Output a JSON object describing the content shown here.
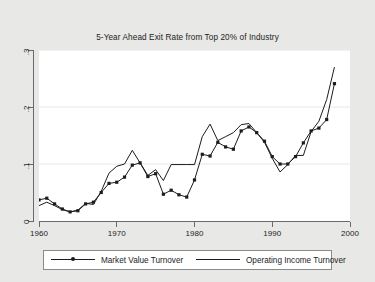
{
  "figure": {
    "background_color": "#e8e8e6",
    "plot_background_color": "#ffffff",
    "line_color": "#1c1c1c",
    "grid_color": "#e6e6e6"
  },
  "chart_data": {
    "type": "line",
    "title": "5-Year Ahead Exit Rate from Top 20% of Industry",
    "xlabel": "",
    "ylabel": "",
    "xlim": [
      1960,
      2000
    ],
    "ylim": [
      0,
      0.3
    ],
    "xticks": [
      1960,
      1970,
      1980,
      1990,
      2000
    ],
    "xtick_labels": [
      "1960",
      "1970",
      "1980",
      "1990",
      "2000"
    ],
    "yticks": [
      0,
      0.1,
      0.2,
      0.3
    ],
    "ytick_labels": [
      "0",
      ".1",
      ".2",
      ".3"
    ],
    "grid": "horizontal",
    "legend_position": "below",
    "x": [
      1960,
      1961,
      1962,
      1963,
      1964,
      1965,
      1966,
      1967,
      1968,
      1969,
      1970,
      1971,
      1972,
      1973,
      1974,
      1975,
      1976,
      1977,
      1978,
      1979,
      1980,
      1981,
      1982,
      1983,
      1984,
      1985,
      1986,
      1987,
      1988,
      1989,
      1990,
      1991,
      1992,
      1993,
      1994,
      1995,
      1996,
      1997,
      1998
    ],
    "series": [
      {
        "name": "Market Value Turnover",
        "marker": "square",
        "values": [
          0.037,
          0.04,
          0.03,
          0.021,
          0.016,
          0.018,
          0.03,
          0.033,
          0.05,
          0.066,
          0.068,
          0.077,
          0.098,
          0.102,
          0.078,
          0.083,
          0.047,
          0.054,
          0.046,
          0.042,
          0.072,
          0.117,
          0.114,
          0.138,
          0.13,
          0.126,
          0.158,
          0.165,
          0.155,
          0.14,
          0.113,
          0.1,
          0.1,
          0.113,
          0.137,
          0.158,
          0.163,
          0.178,
          0.241
        ]
      },
      {
        "name": "Operating Income Turnover",
        "marker": "none",
        "values": [
          0.027,
          0.033,
          0.027,
          0.02,
          0.016,
          0.019,
          0.031,
          0.029,
          0.052,
          0.084,
          0.096,
          0.1,
          0.124,
          0.102,
          0.08,
          0.09,
          0.071,
          0.099,
          0.099,
          0.099,
          0.099,
          0.148,
          0.17,
          0.141,
          0.148,
          0.155,
          0.169,
          0.171,
          0.155,
          0.138,
          0.11,
          0.086,
          0.099,
          0.115,
          0.115,
          0.157,
          0.175,
          0.213,
          0.27
        ]
      }
    ],
    "legend": [
      {
        "label": "Market Value Turnover",
        "marker": true
      },
      {
        "label": "Operating Income Turnover",
        "marker": false
      }
    ]
  }
}
